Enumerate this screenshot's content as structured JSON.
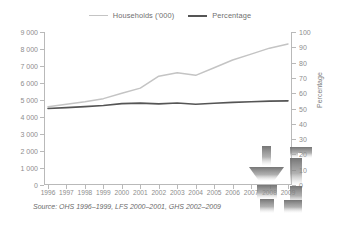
{
  "legend": {
    "items": [
      {
        "label": "Households ('000)",
        "color": "#c4c4c4"
      },
      {
        "label": "Percentage",
        "color": "#555555"
      }
    ]
  },
  "axis_title_right": "Percentage",
  "source_note": "Source: OHS 1996–1999, LFS 2000–2001, GHS 2002–2009",
  "watermark": {
    "name": "faucet-pipe-watermark",
    "color": "#6e6e6e"
  },
  "chart_data": {
    "type": "line",
    "title": "",
    "xlabel": "",
    "ylabel": "",
    "grid": false,
    "legend_position": "top-center",
    "x": [
      1996,
      1997,
      1998,
      1999,
      2000,
      2001,
      2002,
      2003,
      2004,
      2005,
      2006,
      2007,
      2008,
      2009
    ],
    "xtick_labels": [
      "1996",
      "1997",
      "1998",
      "1999",
      "2000",
      "2001",
      "2002",
      "2003",
      "2004",
      "2005",
      "2006",
      "2007",
      "2008",
      "2009"
    ],
    "y_left": {
      "label": "",
      "lim": [
        0,
        9000
      ],
      "ticks": [
        0,
        1000,
        2000,
        3000,
        4000,
        5000,
        6000,
        7000,
        8000,
        9000
      ],
      "tick_labels": [
        "0",
        "1 000",
        "2 000",
        "3 000",
        "4 000",
        "5 000",
        "6 000",
        "7 000",
        "8 000",
        "9 000"
      ]
    },
    "y_right": {
      "label": "Percentage",
      "lim": [
        0,
        100
      ],
      "ticks": [
        0,
        10,
        20,
        30,
        40,
        50,
        60,
        70,
        80,
        90,
        100
      ],
      "tick_labels": [
        "0",
        "10",
        "20",
        "30",
        "40",
        "50",
        "60",
        "70",
        "80",
        "90",
        "100"
      ]
    },
    "series": [
      {
        "name": "Households ('000)",
        "axis": "left",
        "color": "#c4c4c4",
        "width": 1.5,
        "values": [
          4600,
          4750,
          4900,
          5080,
          5400,
          5700,
          6400,
          6600,
          6450,
          6900,
          7350,
          7700,
          8050,
          8300
        ]
      },
      {
        "name": "Percentage",
        "axis": "right",
        "color": "#555555",
        "width": 1.6,
        "values": [
          50.0,
          50.6,
          51.2,
          52.0,
          53.2,
          53.5,
          53.0,
          53.6,
          52.8,
          53.4,
          54.0,
          54.4,
          54.8,
          55.0
        ]
      }
    ]
  }
}
